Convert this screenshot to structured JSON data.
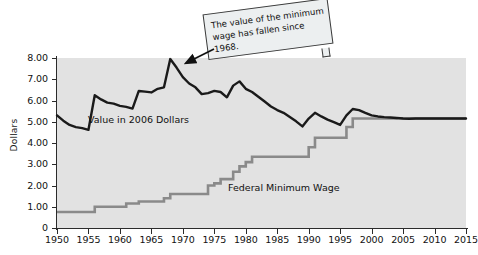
{
  "chart_data": {
    "type": "line",
    "title": "",
    "xlabel": "",
    "ylabel": "Dollars",
    "xlim": [
      1950,
      2015
    ],
    "ylim": [
      0,
      8
    ],
    "yticks": [
      "0",
      "1.00",
      "2.00",
      "3.00",
      "4.00",
      "5.00",
      "6.00",
      "7.00",
      "8.00"
    ],
    "xticks": [
      "1950",
      "1955",
      "1960",
      "1965",
      "1970",
      "1975",
      "1980",
      "1985",
      "1990",
      "1995",
      "2000",
      "2005",
      "2010",
      "2015"
    ],
    "grid": false,
    "legend_position": "inline-labels",
    "background_color": "#e2e2e2",
    "series": [
      {
        "name": "Value in 2006 Dollars",
        "color": "#1a1a1a",
        "style": "line",
        "x": [
          1950,
          1951,
          1952,
          1953,
          1954,
          1955,
          1956,
          1957,
          1958,
          1959,
          1960,
          1961,
          1962,
          1963,
          1964,
          1965,
          1966,
          1967,
          1968,
          1969,
          1970,
          1971,
          1972,
          1973,
          1974,
          1975,
          1976,
          1977,
          1978,
          1979,
          1980,
          1981,
          1982,
          1983,
          1984,
          1985,
          1986,
          1987,
          1988,
          1989,
          1990,
          1991,
          1992,
          1993,
          1994,
          1995,
          1996,
          1997,
          1998,
          1999,
          2000,
          2001,
          2002,
          2003,
          2004,
          2005,
          2006,
          2007,
          2008,
          2009,
          2010,
          2011,
          2012,
          2013,
          2014,
          2015
        ],
        "y": [
          5.3,
          5.05,
          4.85,
          4.75,
          4.7,
          4.62,
          6.25,
          6.05,
          5.9,
          5.85,
          5.75,
          5.7,
          5.62,
          6.45,
          6.42,
          6.38,
          6.55,
          6.62,
          7.95,
          7.55,
          7.1,
          6.8,
          6.62,
          6.3,
          6.35,
          6.45,
          6.4,
          6.15,
          6.7,
          6.9,
          6.55,
          6.4,
          6.18,
          5.95,
          5.72,
          5.55,
          5.42,
          5.22,
          5.02,
          4.78,
          5.15,
          5.42,
          5.25,
          5.1,
          4.98,
          4.85,
          5.3,
          5.6,
          5.55,
          5.42,
          5.3,
          5.25,
          5.22,
          5.2,
          5.18,
          5.15,
          5.14,
          5.15,
          5.15,
          5.15,
          5.15,
          5.15,
          5.15,
          5.15,
          5.15,
          5.15
        ]
      },
      {
        "name": "Federal Minimum Wage",
        "color": "#8a8a8a",
        "style": "step",
        "x": [
          1950,
          1955,
          1956,
          1960,
          1961,
          1962,
          1963,
          1966,
          1967,
          1968,
          1973,
          1974,
          1975,
          1976,
          1977,
          1978,
          1979,
          1980,
          1981,
          1989,
          1990,
          1991,
          1995,
          1996,
          1997,
          2015
        ],
        "y": [
          0.75,
          0.75,
          1.0,
          1.0,
          1.15,
          1.15,
          1.25,
          1.25,
          1.4,
          1.6,
          1.6,
          2.0,
          2.1,
          2.3,
          2.3,
          2.65,
          2.9,
          3.1,
          3.35,
          3.35,
          3.8,
          4.25,
          4.25,
          4.75,
          5.15,
          5.15
        ]
      }
    ],
    "annotations": [
      {
        "name": "callout-1968",
        "text": "The value of the minimum wage has fallen since 1968.",
        "points_to_year": 1968,
        "points_to_value": 7.95
      }
    ]
  },
  "labels": {
    "value_2006": "Value in 2006 Dollars",
    "federal_min_wage": "Federal Minimum Wage"
  }
}
